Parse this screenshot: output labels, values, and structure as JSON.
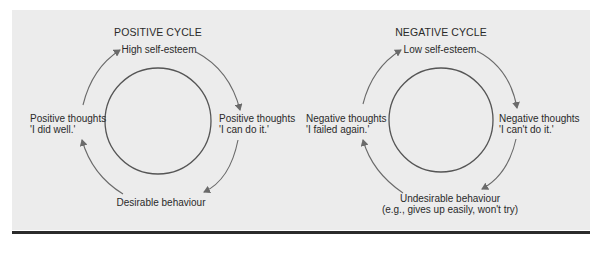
{
  "positive_cycle": {
    "title": "POSITIVE CYCLE",
    "top": "High self-esteem",
    "right_line1": "Positive thoughts",
    "right_line2": "'I can do it.'",
    "bottom": "Desirable behaviour",
    "left_line1": "Positive thoughts",
    "left_line2": "'I did well.'"
  },
  "negative_cycle": {
    "title": "NEGATIVE CYCLE",
    "top": "Low self-esteem",
    "right_line1": "Negative thoughts",
    "right_line2": "'I can't do it.'",
    "bottom_line1": "Undesirable behaviour",
    "bottom_line2": "(e.g., gives up easily, won't try)",
    "left_line1": "Negative thoughts",
    "left_line2": "'I failed again.'"
  },
  "colors": {
    "panel": "#ececec",
    "stroke": "#555555",
    "arrow": "#6a6a6a",
    "rule": "#2b2b2b"
  }
}
